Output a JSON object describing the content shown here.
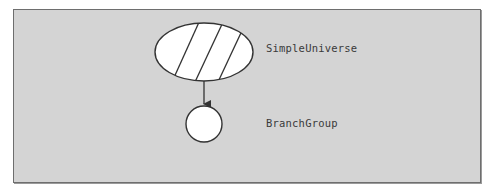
{
  "diagram": {
    "background_color": "#d4d4d4",
    "border_color": "#6e6e6e",
    "nodes": [
      {
        "id": "simple-universe",
        "label": "SimpleUniverse",
        "shape": "hatched-ellipse",
        "fill": "#ffffff",
        "stroke": "#333333"
      },
      {
        "id": "branch-group",
        "label": "BranchGroup",
        "shape": "circle",
        "fill": "#ffffff",
        "stroke": "#333333"
      }
    ],
    "edges": [
      {
        "from": "simple-universe",
        "to": "branch-group",
        "style": "arrow"
      }
    ]
  }
}
